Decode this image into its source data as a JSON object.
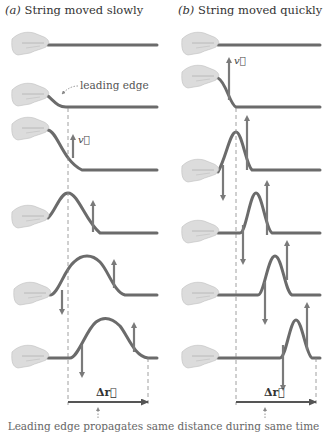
{
  "figure": {
    "panel_a": {
      "letter": "(a)",
      "title": "String moved slowly"
    },
    "panel_b": {
      "letter": "(b)",
      "title": "String moved quickly"
    },
    "annotations": {
      "leading_edge": "leading edge",
      "velocity": "v⃗",
      "displacement": "Δr⃗"
    },
    "caption": "Leading edge propagates same distance during same time",
    "colors": {
      "string": "#6b6b6b",
      "arrow": "#7a7a7a",
      "hand": "#d9d9d9",
      "dashed": "#888888"
    },
    "rows": 6
  }
}
